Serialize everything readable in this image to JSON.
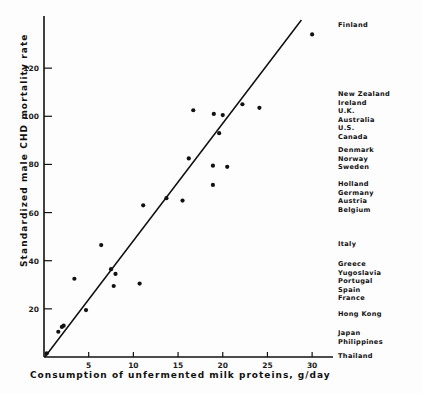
{
  "chart_data": {
    "type": "scatter",
    "title": "",
    "xlabel": "Consumption of unfermented milk proteins, g/day",
    "ylabel": "Standardized male CHD mortality rate",
    "xlim": [
      0,
      32
    ],
    "ylim": [
      0,
      140
    ],
    "xticks": [
      5,
      10,
      15,
      20,
      25,
      30
    ],
    "yticks": [
      20,
      40,
      60,
      80,
      100,
      120
    ],
    "grid": false,
    "legend": "none",
    "points": [
      {
        "x": 0.3,
        "y": 1.5
      },
      {
        "x": 1.6,
        "y": 10.5
      },
      {
        "x": 2.0,
        "y": 12.5
      },
      {
        "x": 2.2,
        "y": 13.0
      },
      {
        "x": 3.4,
        "y": 32.5
      },
      {
        "x": 4.7,
        "y": 19.5
      },
      {
        "x": 6.4,
        "y": 46.5
      },
      {
        "x": 7.5,
        "y": 36.5
      },
      {
        "x": 7.8,
        "y": 29.5
      },
      {
        "x": 8.0,
        "y": 34.5
      },
      {
        "x": 10.7,
        "y": 30.5
      },
      {
        "x": 11.1,
        "y": 63.0
      },
      {
        "x": 13.7,
        "y": 66.0
      },
      {
        "x": 15.5,
        "y": 65.0
      },
      {
        "x": 16.2,
        "y": 82.5
      },
      {
        "x": 16.7,
        "y": 102.5
      },
      {
        "x": 18.9,
        "y": 71.5
      },
      {
        "x": 18.9,
        "y": 79.5
      },
      {
        "x": 19.0,
        "y": 101.0
      },
      {
        "x": 19.6,
        "y": 93.0
      },
      {
        "x": 20.0,
        "y": 100.5
      },
      {
        "x": 20.5,
        "y": 79.0
      },
      {
        "x": 22.2,
        "y": 105.0
      },
      {
        "x": 24.1,
        "y": 103.5
      },
      {
        "x": 30.0,
        "y": 134.0
      }
    ],
    "fit_line": {
      "x1": 0.1,
      "y1": 0.0,
      "x2": 28.8,
      "y2": 140.0
    },
    "annotations": [
      {
        "label_group": [
          "Finland"
        ],
        "y_value": 134
      },
      {
        "label_group": [
          "New Zealand",
          "Ireland",
          "U.K.",
          "Australia",
          "U.S.",
          "Canada"
        ],
        "y_value": 105
      },
      {
        "label_group": [
          "Denmark",
          "Norway",
          "Sweden"
        ],
        "y_value": 82
      },
      {
        "label_group": [
          "Holland",
          "Germany",
          "Austria",
          "Belgium"
        ],
        "y_value": 68
      },
      {
        "label_group": [
          "Italy"
        ],
        "y_value": 47
      },
      {
        "label_group": [
          "Greece",
          "Yugoslavia",
          "Portugal",
          "Spain",
          "France"
        ],
        "y_value": 38
      },
      {
        "label_group": [
          "Hong Kong"
        ],
        "y_value": 20
      },
      {
        "label_group": [
          "Japan",
          "Philippines"
        ],
        "y_value": 12
      },
      {
        "label_group": [
          "Thailand"
        ],
        "y_value": 1
      }
    ]
  },
  "country_groups": [
    {
      "top": 21,
      "names": [
        "Finland"
      ]
    },
    {
      "top": 90,
      "names": [
        "New Zealand",
        "Ireland",
        "U.K.",
        "Australia",
        "U.S.",
        "Canada"
      ]
    },
    {
      "top": 146,
      "names": [
        "Denmark",
        "Norway",
        "Sweden"
      ]
    },
    {
      "top": 180,
      "names": [
        "Holland",
        "Germany",
        "Austria",
        "Belgium"
      ]
    },
    {
      "top": 240,
      "names": [
        "Italy"
      ]
    },
    {
      "top": 260,
      "names": [
        "Greece",
        "Yugoslavia",
        "Portugal",
        "Spain",
        "France"
      ]
    },
    {
      "top": 310,
      "names": [
        "Hong Kong"
      ]
    },
    {
      "top": 329,
      "names": [
        "Japan",
        "Philippines"
      ]
    },
    {
      "top": 352,
      "names": [
        "Thailand"
      ]
    }
  ],
  "colors": {
    "ink": "#111111",
    "background": "#fdfdfd",
    "point": "#111111",
    "line": "#0d0d0d"
  }
}
